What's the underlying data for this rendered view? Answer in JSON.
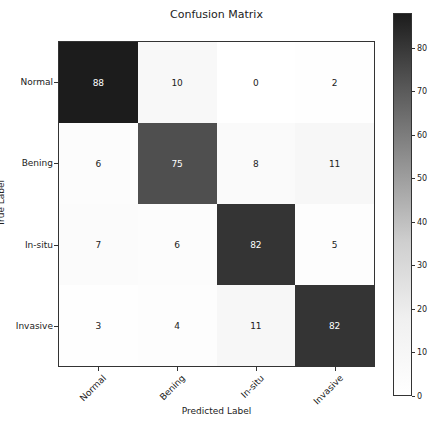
{
  "chart_data": {
    "type": "heatmap",
    "title": "Confusion Matrix",
    "xlabel": "Predicted Label",
    "ylabel": "True Label",
    "x_categories": [
      "Normal",
      "Bening",
      "In-situ",
      "Invasive"
    ],
    "y_categories": [
      "Normal",
      "Bening",
      "In-situ",
      "Invasive"
    ],
    "values": [
      [
        88,
        10,
        0,
        2
      ],
      [
        6,
        75,
        8,
        11
      ],
      [
        7,
        6,
        82,
        5
      ],
      [
        3,
        4,
        11,
        82
      ]
    ],
    "colormap": "Greys",
    "colorbar": {
      "range": [
        0,
        88
      ],
      "ticks": [
        0,
        10,
        20,
        30,
        40,
        50,
        60,
        70,
        80
      ]
    }
  },
  "labels": {
    "title": "Confusion Matrix",
    "xlabel": "Predicted Label",
    "ylabel": "True Label",
    "classes": [
      "Normal",
      "Bening",
      "In-situ",
      "Invasive"
    ],
    "cbar_ticks": [
      "0",
      "10",
      "20",
      "30",
      "40",
      "50",
      "60",
      "70",
      "80"
    ]
  },
  "cells": [
    [
      "88",
      "10",
      "0",
      "2"
    ],
    [
      "6",
      "75",
      "8",
      "11"
    ],
    [
      "7",
      "6",
      "82",
      "5"
    ],
    [
      "3",
      "4",
      "11",
      "82"
    ]
  ]
}
